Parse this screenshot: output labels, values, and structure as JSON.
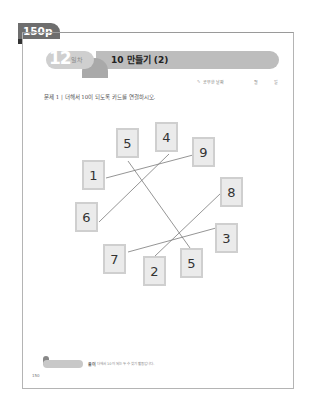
{
  "page_tab": "150p",
  "header": {
    "day_number": "12",
    "day_label": "일차",
    "title": "10 만들기 (2)",
    "studied_date_label": "공부한 날짜",
    "month_label": "월",
    "day_unit_label": "일"
  },
  "question": {
    "text": "문제 1 | 더해서 10이 되도록 카드를 연결하시오."
  },
  "cards": [
    {
      "id": "c5a",
      "value": "5",
      "x": 116,
      "y": 128
    },
    {
      "id": "c4",
      "value": "4",
      "x": 155,
      "y": 122
    },
    {
      "id": "c9",
      "value": "9",
      "x": 192,
      "y": 137
    },
    {
      "id": "c1",
      "value": "1",
      "x": 82,
      "y": 160
    },
    {
      "id": "c8",
      "value": "8",
      "x": 220,
      "y": 177
    },
    {
      "id": "c6",
      "value": "6",
      "x": 75,
      "y": 202
    },
    {
      "id": "c3",
      "value": "3",
      "x": 215,
      "y": 223
    },
    {
      "id": "c7",
      "value": "7",
      "x": 103,
      "y": 244
    },
    {
      "id": "c2",
      "value": "2",
      "x": 143,
      "y": 256
    },
    {
      "id": "c5b",
      "value": "5",
      "x": 180,
      "y": 248
    }
  ],
  "connections": [
    {
      "from": "1",
      "to": "9",
      "x1": 106,
      "y1": 178,
      "x2": 193,
      "y2": 155
    },
    {
      "from": "6",
      "to": "4",
      "x1": 99,
      "y1": 222,
      "x2": 169,
      "y2": 154
    },
    {
      "from": "5",
      "to": "5",
      "x1": 128,
      "y1": 161,
      "x2": 190,
      "y2": 248
    },
    {
      "from": "2",
      "to": "8",
      "x1": 155,
      "y1": 256,
      "x2": 221,
      "y2": 193
    },
    {
      "from": "7",
      "to": "3",
      "x1": 128,
      "y1": 252,
      "x2": 216,
      "y2": 228
    }
  ],
  "footer": {
    "hint_label": "풀이",
    "hint_text": "더해서 10이 되는 두 수 찾기 활동입니다.",
    "page_number": "150"
  }
}
